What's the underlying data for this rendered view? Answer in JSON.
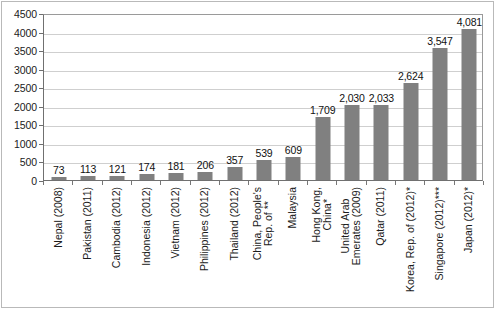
{
  "chart_data": {
    "type": "bar",
    "title": "",
    "subtitle": "",
    "xlabel": "",
    "ylabel": "",
    "ylim": [
      0,
      4500
    ],
    "ytick_step": 500,
    "yticks": [
      "4500",
      "4000",
      "3500",
      "3000",
      "2500",
      "2000",
      "1500",
      "1000",
      "500",
      "0"
    ],
    "grid": true,
    "legend": "none",
    "bar_color": "#808080",
    "categories": [
      "Nepal (2008)",
      "Pakistan (2011)",
      "Cambodia (2012)",
      "Indonesia (2012)",
      "Vietnam (2012)",
      "Philippines (2012)",
      "Thailand (2012)",
      "China, People's Rep. of **",
      "Malaysia",
      "Hong Kong, China*",
      "United Arab Emerates (2009)",
      "Qatar (2011)",
      "Korea, Rep. of (2012)*",
      "Singapore (2012)***",
      "Japan (2012)*"
    ],
    "category_lines": [
      [
        "Nepal (2008)"
      ],
      [
        "Pakistan (2011)"
      ],
      [
        "Cambodia (2012)"
      ],
      [
        "Indonesia (2012)"
      ],
      [
        "Vietnam (2012)"
      ],
      [
        "Philippines (2012)"
      ],
      [
        "Thailand (2012)"
      ],
      [
        "China, People's",
        "Rep. of **"
      ],
      [
        "Malaysia"
      ],
      [
        "Hong Kong,",
        "China*"
      ],
      [
        "United Arab",
        "Emerates (2009)"
      ],
      [
        "Qatar (2011)"
      ],
      [
        "Korea, Rep. of (2012)*"
      ],
      [
        "Singapore (2012)***"
      ],
      [
        "Japan (2012)*"
      ]
    ],
    "values": [
      73,
      113,
      121,
      174,
      181,
      206,
      357,
      539,
      609,
      1709,
      2030,
      2033,
      2624,
      3547,
      4081
    ],
    "value_labels": [
      "73",
      "113",
      "121",
      "174",
      "181",
      "206",
      "357",
      "539",
      "609",
      "1,709",
      "2,030",
      "2,033",
      "2,624",
      "3,547",
      "4,081"
    ]
  }
}
